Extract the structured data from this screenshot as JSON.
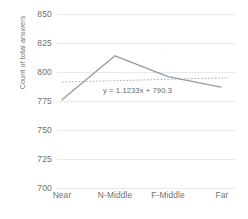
{
  "chart_data": {
    "type": "line",
    "title": "",
    "xlabel": "",
    "ylabel": "Count of total answers",
    "categories": [
      "Near",
      "N-Middle",
      "F-Middle",
      "Far"
    ],
    "values": [
      776,
      814,
      796,
      787
    ],
    "series": [
      {
        "name": "Count of total answers",
        "values": [
          776,
          814,
          796,
          787
        ]
      }
    ],
    "ylim": [
      700,
      850
    ],
    "yticks": [
      700,
      725,
      750,
      775,
      800,
      825,
      850
    ],
    "ytick_labels": [
      "700",
      "725",
      "750",
      "775",
      "800",
      "825",
      "850"
    ],
    "grid": true,
    "legend": "none",
    "trendline": {
      "type": "linear",
      "equation": "y = 1.1233x + 790.3",
      "slope": 1.1233,
      "intercept": 790.3,
      "style": "dotted",
      "values": [
        791.4,
        792.5,
        793.7,
        794.8
      ]
    },
    "colors": {
      "series_line": "#808b96",
      "trendline": "#9aa2a8",
      "gridline": "#e8eaec",
      "text": "#6f6f6f"
    }
  }
}
